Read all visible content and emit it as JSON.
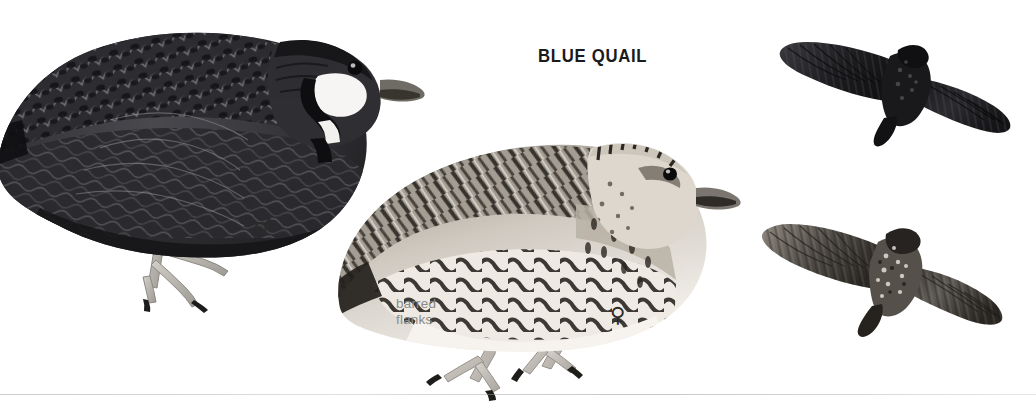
{
  "plate": {
    "title": "BLUE QUAIL",
    "background_color": "#ffffff",
    "title_color": "#1b1b1b",
    "annotation_color": "#8a8a8a",
    "rule_color": "#b0b0b5"
  },
  "annotations": [
    {
      "id": "barred-flanks",
      "text": "barred\nflanks"
    }
  ],
  "symbols": {
    "male": "♂",
    "female": "♀"
  },
  "figures": [
    {
      "id": "male-perched",
      "name": "male-quail-standing",
      "sex": "male",
      "pose": "standing, facing right",
      "description": "Dark slate-and-black quail with scalloped upperparts, white throat patch bordered by a black anchor mark, pale grey legs."
    },
    {
      "id": "female-perched",
      "name": "female-quail-standing",
      "sex": "female",
      "pose": "standing, facing right",
      "description": "Buff-and-grey quail with heavily barred flanks, streaked brown upperparts, pale face and whitish belly."
    },
    {
      "id": "male-flight",
      "name": "male-quail-in-flight",
      "sex": "male",
      "pose": "flying, seen from above",
      "description": "Very dark, almost blackish quail in flight with broad spread wings."
    },
    {
      "id": "female-flight",
      "name": "female-quail-in-flight",
      "sex": "female",
      "pose": "flying, seen from above",
      "description": "Mottled grey-brown quail in flight with broad spread wings and pale speckling."
    }
  ],
  "palette": {
    "male_dark": "#232326",
    "male_mid": "#3c3c40",
    "male_light": "#6d6d72",
    "female_dark": "#3a352f",
    "female_mid": "#8c857b",
    "female_pale": "#ebe7e0",
    "leg_grey": "#b9b6b0",
    "bill_grey": "#6b6762"
  }
}
